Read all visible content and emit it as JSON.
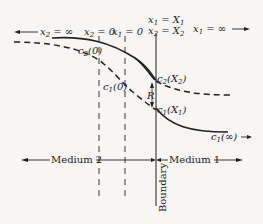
{
  "diagram": {
    "colors": {
      "ink": "#222222",
      "background": "#f7f6f4"
    },
    "labels": {
      "x2_inf": {
        "var": "x",
        "sub": "2",
        "rel": " = ∞",
        "arrow": "left"
      },
      "x2_zero": {
        "var": "x",
        "sub": "2",
        "rel": " = 0"
      },
      "x1_zero": {
        "var": "x",
        "sub": "1",
        "rel": " = 0"
      },
      "x1_X1": {
        "var": "x",
        "sub": "1",
        "rel": " = X",
        "rel_sub": "1"
      },
      "x2_X2": {
        "var": "x",
        "sub": "2",
        "rel": " = X",
        "rel_sub": "2"
      },
      "x1_inf": {
        "var": "x",
        "sub": "1",
        "rel": " = ∞",
        "arrow": "right"
      },
      "c2_0": {
        "var": "c",
        "sub": "2",
        "arg": "(0)"
      },
      "c1_0": {
        "var": "c",
        "sub": "1",
        "arg": "(0)"
      },
      "c2_X2": {
        "var": "c",
        "sub": "2",
        "arg_open": "(X",
        "arg_sub": "2",
        "arg_close": ")"
      },
      "c1_X1": {
        "var": "c",
        "sub": "1",
        "arg_open": "(X",
        "arg_sub": "1",
        "arg_close": ")"
      },
      "c1_inf": {
        "var": "c",
        "sub": "1",
        "arg": "(∞)",
        "arrow": "right"
      },
      "R": "R",
      "medium2": "Medium 2",
      "medium1": "Medium 1",
      "boundary": "Boundary"
    },
    "curves": [
      {
        "name": "c1-solid",
        "style": "solid",
        "description": "Concentration in medium 1 coordinate"
      },
      {
        "name": "c2-dashed",
        "style": "dashed",
        "description": "Concentration in medium 2 coordinate"
      }
    ]
  }
}
